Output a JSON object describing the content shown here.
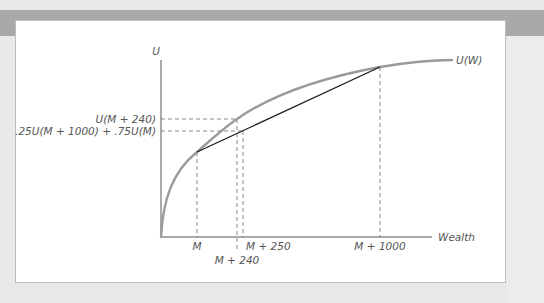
{
  "figure": {
    "axis_labels": {
      "y": "U",
      "x": "Wealth"
    },
    "curve_label": "U(W)",
    "y_ticks": [
      {
        "label": "U(M + 240)",
        "y": 119
      },
      {
        "label": ".25U(M + 1000) + .75U(M)",
        "y": 131
      }
    ],
    "x_ticks": [
      {
        "label": "M",
        "x": 197
      },
      {
        "label": "M + 240",
        "x": 237
      },
      {
        "label": "M + 250",
        "x": 243
      },
      {
        "label": "M + 1000",
        "x": 380
      }
    ],
    "colors": {
      "curve": "#9a9a9a",
      "chord": "#1a1a1a",
      "axes": "#555555",
      "dashes": "#6a6a6a"
    }
  }
}
